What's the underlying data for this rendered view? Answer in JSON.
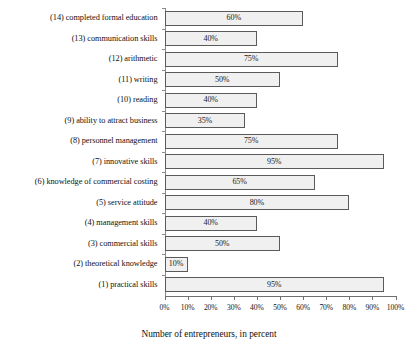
{
  "chart_data": {
    "type": "bar",
    "orientation": "horizontal",
    "title": "",
    "xlabel": "Number of entrepreneurs, in percent",
    "ylabel": "",
    "xlim": [
      0,
      100
    ],
    "grid": false,
    "legend": null,
    "value_suffix": "%",
    "categories": [
      "(14) completed formal education",
      "(13) communication skills",
      "(12) arithmetic",
      "(11) writing",
      "(10) reading",
      "(9) ability to attract business",
      "(8) personnel management",
      "(7) innovative skills",
      "(6) knowledge of commercial costing",
      "(5) service attitude",
      "(4) management skills",
      "(3) commercial skills",
      "(2) theoretical knowledge",
      "(1) practical skills"
    ],
    "values": [
      60,
      40,
      75,
      50,
      40,
      35,
      75,
      95,
      65,
      80,
      40,
      50,
      10,
      95
    ],
    "value_labels": [
      "60%",
      "40%",
      "75%",
      "50%",
      "40%",
      "35%",
      "75%",
      "95%",
      "65%",
      "80%",
      "40%",
      "50%",
      "10%",
      "95%"
    ],
    "xticks": [
      0,
      10,
      20,
      30,
      40,
      50,
      60,
      70,
      80,
      90,
      100
    ],
    "xtick_labels": [
      "0%",
      "10%",
      "20%",
      "30%",
      "40%",
      "50%",
      "60%",
      "70%",
      "80%",
      "90%",
      "100%"
    ],
    "colors": {
      "bar_fill": "#f0f0f0",
      "bar_border": "#5a5a5a",
      "axis": "#6f6f6f",
      "text": "#121212",
      "background": "#ffffff"
    }
  }
}
